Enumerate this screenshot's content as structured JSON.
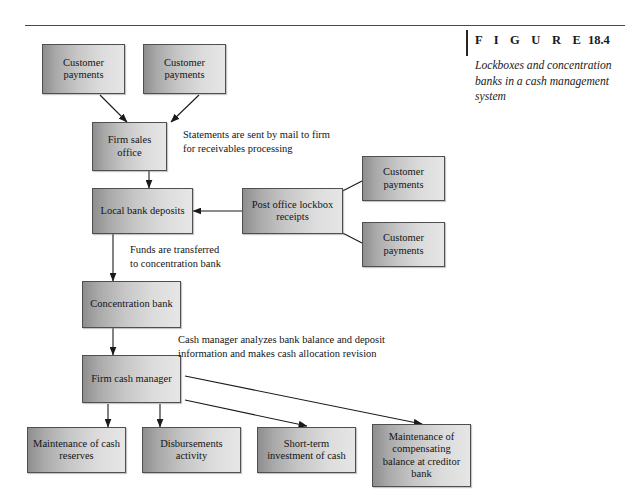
{
  "figure": {
    "label_word": "F I G U R E",
    "number": "18.4",
    "caption": "Lockboxes and concentration banks in a cash management system"
  },
  "nodes": [
    {
      "id": "customer-payments-top-left",
      "label": "Customer payments"
    },
    {
      "id": "customer-payments-top-right",
      "label": "Customer payments"
    },
    {
      "id": "firm-sales-office",
      "label": "Firm sales office"
    },
    {
      "id": "local-bank-deposits",
      "label": "Local bank deposits"
    },
    {
      "id": "post-office-lockbox-receipts",
      "label": "Post office lockbox receipts"
    },
    {
      "id": "customer-payments-right-upper",
      "label": "Customer payments"
    },
    {
      "id": "customer-payments-right-lower",
      "label": "Customer payments"
    },
    {
      "id": "concentration-bank",
      "label": "Concentration bank"
    },
    {
      "id": "firm-cash-manager",
      "label": "Firm cash manager"
    },
    {
      "id": "maintenance-cash-reserves",
      "label": "Maintenance of cash reserves"
    },
    {
      "id": "disbursements-activity",
      "label": "Disbursements activity"
    },
    {
      "id": "short-term-investment",
      "label": "Short-term investment of cash"
    },
    {
      "id": "compensating-balance",
      "label": "Maintenance of compensating balance at creditor bank"
    }
  ],
  "annotations": [
    {
      "id": "statements-note",
      "text": "Statements are sent by mail to firm\nfor receivables processing"
    },
    {
      "id": "funds-transfer-note",
      "text": "Funds are transferred\nto concentration bank"
    },
    {
      "id": "cash-manager-note",
      "text": "Cash manager analyzes bank balance and deposit\ninformation and makes cash allocation revision"
    }
  ],
  "colors": {
    "box_border": "#4f4f4f",
    "box_fill_dark": "#8e8e8e",
    "box_fill_light": "#e6e6e6",
    "rule": "#4a4a4a",
    "text": "#141414",
    "arrow": "#1a1a1a"
  }
}
